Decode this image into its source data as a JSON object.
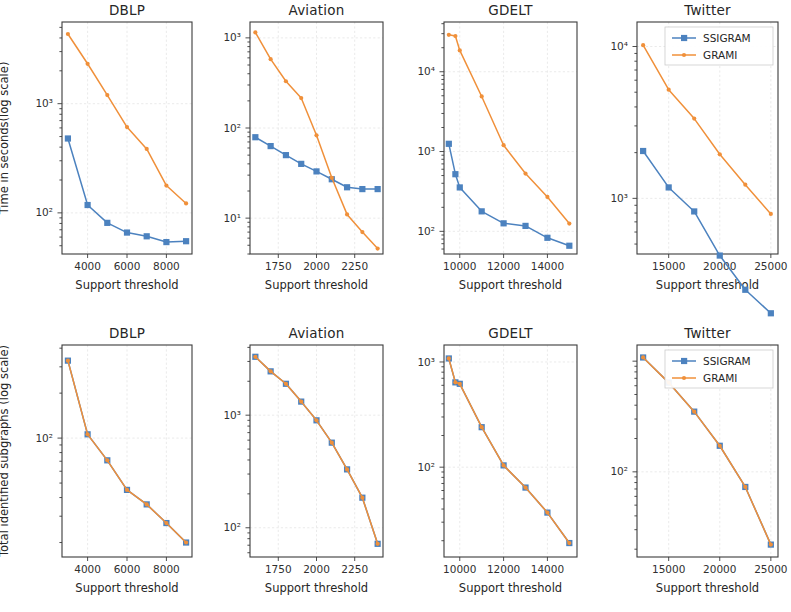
{
  "figure": {
    "width": 791,
    "height": 612,
    "background": "#ffffff",
    "rows": 2,
    "cols": 4
  },
  "style": {
    "ssigram_color": "#4c82bf",
    "grami_color": "#f0903a",
    "axis_color": "#3b3b3b",
    "grid_color": "#e8e8e8",
    "text_color": "#262626"
  },
  "legend": {
    "position": "upper right",
    "entries": [
      {
        "label": "SSIGRAM",
        "color": "#4c82bf",
        "marker": "square"
      },
      {
        "label": "GRAMI",
        "color": "#f0903a",
        "marker": "dot"
      }
    ],
    "shown_on_panels": [
      "top-twitter",
      "bottom-twitter"
    ]
  },
  "axis_labels": {
    "x": "Support threshold",
    "y_top": "Time in seconds(log scale)",
    "y_bottom": "Total identified subgraphs (log scale)"
  },
  "chart_data": [
    {
      "id": "top-dblp",
      "type": "line",
      "title": "DBLP",
      "xlabel": "Support threshold",
      "ylabel": "Time in seconds(log scale)",
      "yscale": "log",
      "xlim": [
        2700,
        9300
      ],
      "ylim": [
        42,
        5600
      ],
      "xticks": [
        4000,
        6000,
        8000
      ],
      "xticklabels": [
        "4000",
        "6000",
        "8000"
      ],
      "yticks": [
        100,
        1000
      ],
      "yticklabels": [
        "10²",
        "10³"
      ],
      "grid": true,
      "x": [
        3000,
        4000,
        5000,
        6000,
        7000,
        8000,
        9000
      ],
      "series": [
        {
          "name": "SSIGRAM",
          "color": "#4c82bf",
          "values": [
            480,
            118,
            81,
            66,
            61,
            54,
            55
          ]
        },
        {
          "name": "GRAMI",
          "color": "#f0903a",
          "values": [
            4350,
            2320,
            1200,
            610,
            385,
            178,
            122
          ]
        }
      ]
    },
    {
      "id": "top-aviation",
      "type": "line",
      "title": "Aviation",
      "xlabel": "Support threshold",
      "ylabel": "",
      "yscale": "log",
      "xlim": [
        1565,
        2435
      ],
      "ylim": [
        4.0,
        1500
      ],
      "xticks": [
        1750,
        2000,
        2250
      ],
      "xticklabels": [
        "1750",
        "2000",
        "2250"
      ],
      "yticks": [
        10,
        100,
        1000
      ],
      "yticklabels": [
        "10¹",
        "10²",
        "10³"
      ],
      "grid": true,
      "x": [
        1600,
        1700,
        1800,
        1900,
        2000,
        2100,
        2200,
        2300,
        2400
      ],
      "series": [
        {
          "name": "SSIGRAM",
          "color": "#4c82bf",
          "values": [
            79,
            63,
            50,
            40,
            33,
            27,
            22,
            21,
            21
          ]
        },
        {
          "name": "GRAMI",
          "color": "#f0903a",
          "values": [
            1150,
            580,
            330,
            215,
            83,
            28,
            11.0,
            7.0,
            4.6
          ]
        }
      ]
    },
    {
      "id": "top-gdelt",
      "type": "line",
      "title": "GDELT",
      "xlabel": "Support threshold",
      "ylabel": "",
      "yscale": "log",
      "xlim": [
        9280,
        15350
      ],
      "ylim": [
        52,
        42000
      ],
      "xticks": [
        10000,
        12000,
        14000
      ],
      "xticklabels": [
        "10000",
        "12000",
        "14000"
      ],
      "yticks": [
        100,
        1000,
        10000
      ],
      "yticklabels": [
        "10²",
        "10³",
        "10⁴"
      ],
      "grid": true,
      "x": [
        9500,
        9800,
        10000,
        11000,
        12000,
        13000,
        14000,
        15000
      ],
      "series": [
        {
          "name": "SSIGRAM",
          "color": "#4c82bf",
          "values": [
            1250,
            520,
            355,
            178,
            126,
            117,
            83,
            66
          ]
        },
        {
          "name": "GRAMI",
          "color": "#f0903a",
          "values": [
            29000,
            28000,
            18500,
            4900,
            1200,
            530,
            270,
            125
          ]
        }
      ]
    },
    {
      "id": "top-twitter",
      "type": "line",
      "title": "Twitter",
      "xlabel": "Support threshold",
      "ylabel": "",
      "yscale": "log",
      "xlim": [
        11900,
        25700
      ],
      "ylim": [
        430,
        14500
      ],
      "xticks": [
        15000,
        20000,
        25000
      ],
      "xticklabels": [
        "15000",
        "20000",
        "25000"
      ],
      "yticks": [
        1000,
        10000
      ],
      "yticklabels": [
        "10³",
        "10⁴"
      ],
      "grid": true,
      "x": [
        12500,
        15000,
        17500,
        20000,
        22500,
        25000
      ],
      "series": [
        {
          "name": "SSIGRAM",
          "color": "#4c82bf",
          "values": [
            2050,
            1180,
            820,
            420,
            250,
            175
          ]
        },
        {
          "name": "GRAMI",
          "color": "#f0903a",
          "values": [
            10200,
            5200,
            3350,
            1950,
            1230,
            790
          ]
        }
      ]
    },
    {
      "id": "bottom-dblp",
      "type": "line",
      "title": "DBLP",
      "xlabel": "Support threshold",
      "ylabel": "Total identified subgraphs (log scale)",
      "yscale": "log",
      "xlim": [
        2700,
        9300
      ],
      "ylim": [
        16,
        420
      ],
      "xticks": [
        4000,
        6000,
        8000
      ],
      "xticklabels": [
        "4000",
        "6000",
        "8000"
      ],
      "yticks": [
        100
      ],
      "yticklabels": [
        "10²"
      ],
      "grid": true,
      "x": [
        3000,
        4000,
        5000,
        6000,
        7000,
        8000,
        9000
      ],
      "series": [
        {
          "name": "SSIGRAM",
          "color": "#4c82bf",
          "values": [
            330,
            106,
            71,
            45,
            36,
            27,
            20
          ]
        },
        {
          "name": "GRAMI",
          "color": "#f0903a",
          "values": [
            330,
            106,
            71,
            45,
            36,
            27,
            20
          ]
        }
      ]
    },
    {
      "id": "bottom-aviation",
      "type": "line",
      "title": "Aviation",
      "xlabel": "Support threshold",
      "ylabel": "",
      "yscale": "log",
      "xlim": [
        1565,
        2435
      ],
      "ylim": [
        55,
        4200
      ],
      "xticks": [
        1750,
        2000,
        2250
      ],
      "xticklabels": [
        "1750",
        "2000",
        "2250"
      ],
      "yticks": [
        100,
        1000
      ],
      "yticklabels": [
        "10²",
        "10³"
      ],
      "grid": true,
      "x": [
        1600,
        1700,
        1800,
        1900,
        2000,
        2100,
        2200,
        2300,
        2400
      ],
      "series": [
        {
          "name": "SSIGRAM",
          "color": "#4c82bf",
          "values": [
            3300,
            2450,
            1900,
            1320,
            900,
            570,
            330,
            185,
            72
          ]
        },
        {
          "name": "GRAMI",
          "color": "#f0903a",
          "values": [
            3300,
            2450,
            1900,
            1320,
            900,
            570,
            330,
            185,
            72
          ]
        }
      ]
    },
    {
      "id": "bottom-gdelt",
      "type": "line",
      "title": "GDELT",
      "xlabel": "Support threshold",
      "ylabel": "",
      "yscale": "log",
      "xlim": [
        9280,
        15350
      ],
      "ylim": [
        14,
        1450
      ],
      "xticks": [
        10000,
        12000,
        14000
      ],
      "xticklabels": [
        "10000",
        "12000",
        "14000"
      ],
      "yticks": [
        100,
        1000
      ],
      "yticklabels": [
        "10²",
        "10³"
      ],
      "grid": true,
      "x": [
        9500,
        9800,
        10000,
        11000,
        12000,
        13000,
        14000,
        15000
      ],
      "series": [
        {
          "name": "SSIGRAM",
          "color": "#4c82bf",
          "values": [
            1080,
            640,
            620,
            240,
            104,
            64,
            37,
            19
          ]
        },
        {
          "name": "GRAMI",
          "color": "#f0903a",
          "values": [
            1080,
            640,
            620,
            240,
            104,
            64,
            37,
            19
          ]
        }
      ]
    },
    {
      "id": "bottom-twitter",
      "type": "line",
      "title": "Twitter",
      "xlabel": "Support threshold",
      "ylabel": "",
      "yscale": "log",
      "xlim": [
        11900,
        25700
      ],
      "ylim": [
        17,
        1400
      ],
      "xticks": [
        15000,
        20000,
        25000
      ],
      "xticklabels": [
        "15000",
        "20000",
        "25000"
      ],
      "yticks": [
        100
      ],
      "yticklabels": [
        "10²"
      ],
      "grid": true,
      "x": [
        12500,
        15000,
        17500,
        20000,
        22500,
        25000
      ],
      "series": [
        {
          "name": "SSIGRAM",
          "color": "#4c82bf",
          "values": [
            1080,
            640,
            350,
            172,
            73,
            22
          ]
        },
        {
          "name": "GRAMI",
          "color": "#f0903a",
          "values": [
            1080,
            640,
            350,
            172,
            73,
            22
          ]
        }
      ]
    }
  ]
}
